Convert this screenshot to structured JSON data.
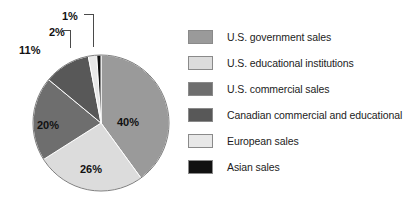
{
  "chart_data": {
    "type": "pie",
    "title": "",
    "subtitle": "",
    "xlabel": "",
    "ylabel": "",
    "legend_position": "right",
    "grid": false,
    "unit": "%",
    "categories": [
      "U.S. government sales",
      "U.S. educational institutions",
      "U.S. commercial sales",
      "Canadian commercial and educational",
      "European sales",
      "Asian sales"
    ],
    "values": [
      40,
      26,
      20,
      11,
      2,
      1
    ],
    "data_labels": [
      "40%",
      "26%",
      "20%",
      "11%",
      "2%",
      "1%"
    ],
    "colors": [
      "#9a9a9a",
      "#dcdcdc",
      "#6e6e6e",
      "#585858",
      "#e8e8e8",
      "#111111"
    ],
    "start_angle_deg": 0,
    "direction": "clockwise",
    "slices": [
      {
        "label": "U.S. government sales",
        "value": 40,
        "data_label": "40%",
        "color": "#9a9a9a",
        "callout": false
      },
      {
        "label": "U.S. educational institutions",
        "value": 26,
        "data_label": "26%",
        "color": "#dcdcdc",
        "callout": false
      },
      {
        "label": "U.S. commercial sales",
        "value": 20,
        "data_label": "20%",
        "color": "#6e6e6e",
        "callout": false
      },
      {
        "label": "Canadian commercial and educational",
        "value": 11,
        "data_label": "11%",
        "color": "#585858",
        "callout": false
      },
      {
        "label": "European sales",
        "value": 2,
        "data_label": "2%",
        "color": "#e8e8e8",
        "callout": true
      },
      {
        "label": "Asian sales",
        "value": 1,
        "data_label": "1%",
        "color": "#111111",
        "callout": true
      }
    ]
  },
  "legend": {
    "items": [
      {
        "label": "U.S. government sales",
        "color": "#9a9a9a"
      },
      {
        "label": "U.S. educational institutions",
        "color": "#dcdcdc"
      },
      {
        "label": "U.S. commercial sales",
        "color": "#6e6e6e"
      },
      {
        "label": "Canadian commercial and educational",
        "color": "#585858"
      },
      {
        "label": "European sales",
        "color": "#e8e8e8"
      },
      {
        "label": "Asian sales",
        "color": "#111111"
      }
    ]
  }
}
